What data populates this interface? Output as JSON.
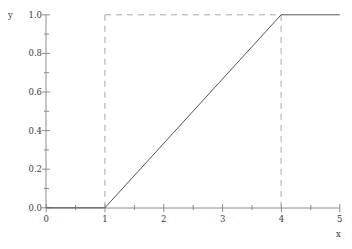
{
  "chart_data": {
    "type": "line",
    "title": "",
    "xlabel": "x",
    "ylabel": "y",
    "xlim": [
      0,
      5
    ],
    "ylim": [
      0,
      1.0
    ],
    "grid": false,
    "legend": null,
    "xticks": [
      0,
      1,
      2,
      3,
      4,
      5
    ],
    "xtick_labels": [
      "0",
      "1",
      "2",
      "3",
      "4",
      "5"
    ],
    "x_minor_ticks": [
      0.5,
      1.5,
      2.5,
      3.5,
      4.5
    ],
    "yticks": [
      0.0,
      0.2,
      0.4,
      0.6,
      0.8,
      1.0
    ],
    "ytick_labels": [
      "0.0",
      "0.2",
      "0.4",
      "0.6",
      "0.8",
      "1.0"
    ],
    "y_minor_ticks": [
      0.1,
      0.3,
      0.5,
      0.7,
      0.9
    ],
    "series": [
      {
        "name": "cdf",
        "style": "solid",
        "color": "#555555",
        "points": [
          {
            "x": 0,
            "y": 0.0
          },
          {
            "x": 1,
            "y": 0.0
          },
          {
            "x": 4,
            "y": 1.0
          },
          {
            "x": 5,
            "y": 1.0
          }
        ]
      }
    ],
    "guides": [
      {
        "name": "vertical-guide-x1",
        "style": "dashed",
        "color": "#a8a8a8",
        "x": 1,
        "y_from": 0.0,
        "y_to": 1.0
      },
      {
        "name": "vertical-guide-x4",
        "style": "dashed",
        "color": "#a8a8a8",
        "x": 4,
        "y_from": 0.0,
        "y_to": 1.0
      },
      {
        "name": "horizontal-guide-y1",
        "style": "dashed",
        "color": "#a8a8a8",
        "y": 1.0,
        "x_from": 1,
        "x_to": 4
      }
    ],
    "annotations": []
  },
  "colors": {
    "background": "#ffffff",
    "axis": "#8c8c8c",
    "data_line": "#555555",
    "guide_line": "#a8a8a8",
    "text": "#3a3a3a"
  }
}
